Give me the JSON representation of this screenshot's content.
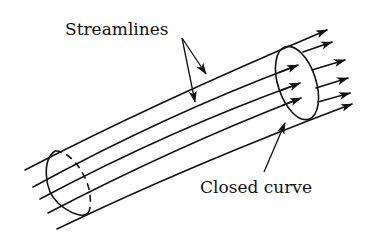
{
  "figure": {
    "labels": {
      "streamlines": "Streamlines",
      "closed_curve": "Closed curve"
    },
    "streamline_count": 5,
    "colors": {
      "ink": "#111111",
      "background": "#ffffff"
    }
  }
}
